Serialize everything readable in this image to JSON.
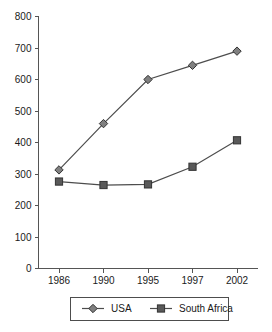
{
  "chart_data": {
    "type": "line",
    "title": "",
    "xlabel": "",
    "ylabel": "",
    "categories": [
      "1986",
      "1990",
      "1995",
      "1997",
      "2002"
    ],
    "ylim": [
      0,
      800
    ],
    "yticks": [
      0,
      100,
      200,
      300,
      400,
      500,
      600,
      700,
      800
    ],
    "ytick_labels": [
      "0",
      "100",
      "200",
      "300",
      "400",
      "500",
      "600",
      "700",
      "800"
    ],
    "grid": false,
    "legend_position": "bottom",
    "series": [
      {
        "name": "USA",
        "marker": "diamond",
        "color": "#808080",
        "line_color": "#4d4d4d",
        "values": [
          313,
          460,
          600,
          645,
          690
        ]
      },
      {
        "name": "South Africa",
        "marker": "square",
        "color": "#595959",
        "line_color": "#4d4d4d",
        "values": [
          276,
          265,
          267,
          323,
          407
        ]
      }
    ]
  },
  "legend": {
    "items": [
      {
        "label": "USA",
        "marker": "diamond-marker"
      },
      {
        "label": "South Africa",
        "marker": "square-marker"
      }
    ]
  },
  "colors": {
    "axis": "#555555",
    "line": "#4d4d4d",
    "usa_marker": "#808080",
    "south_africa_marker": "#595959",
    "background": "#ffffff",
    "text": "#1a1a1a"
  }
}
